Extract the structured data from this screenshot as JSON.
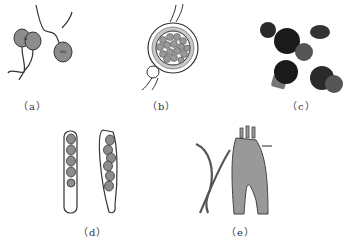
{
  "figure": {
    "panels": [
      {
        "id": "a",
        "caption": "（a）",
        "subject": "biflagellate zoospores with nuclei"
      },
      {
        "id": "b",
        "caption": "（b）",
        "subject": "sporangium containing spores with attached cell"
      },
      {
        "id": "c",
        "caption": "（c）",
        "subject": "dark spherical spores cluster"
      },
      {
        "id": "d",
        "caption": "（d）",
        "subject": "two asci containing eight ascospores"
      },
      {
        "id": "e",
        "caption": "（e）",
        "subject": "hyphae and conidiophore structure"
      }
    ],
    "colors": {
      "cell_gray": "#8c8c8c",
      "outline": "#333333",
      "dark_spore": "#2a2a2a",
      "background": "#ffffff"
    }
  }
}
